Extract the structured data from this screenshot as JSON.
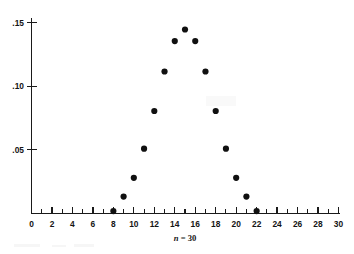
{
  "figure": {
    "name": "binomial-distribution-scatter-plot",
    "background_color": "#ffffff",
    "ink_color": "#101010"
  },
  "chart_data": {
    "type": "scatter",
    "title": "",
    "subtitle": "",
    "xlabel": "n = 30",
    "xlabel_italic_part": "n",
    "xlabel_plain_part": " = 30",
    "ylabel": "",
    "grid": false,
    "legend": null,
    "xlim": [
      0,
      30
    ],
    "ylim": [
      0,
      0.155
    ],
    "xticks_major": [
      0,
      2,
      4,
      6,
      8,
      10,
      12,
      14,
      16,
      18,
      20,
      22,
      24,
      26,
      28,
      30
    ],
    "xtick_labels": [
      "0",
      "2",
      "4",
      "6",
      "8",
      "10",
      "12",
      "14",
      "16",
      "18",
      "20",
      "22",
      "24",
      "26",
      "28",
      "30"
    ],
    "xticks_minor": [
      1,
      3,
      5,
      7,
      9,
      11,
      13,
      15,
      17,
      19,
      21,
      23,
      25,
      27,
      29
    ],
    "xtick_step": 1,
    "yticks": [
      0.05,
      0.1,
      0.15
    ],
    "ytick_labels": [
      ".05",
      ".10",
      ".15"
    ],
    "x": [
      8,
      9,
      10,
      11,
      12,
      13,
      14,
      15,
      16,
      17,
      18,
      19,
      20,
      21,
      22
    ],
    "values": [
      0.0019,
      0.0133,
      0.028,
      0.0509,
      0.0805,
      0.1115,
      0.1354,
      0.1445,
      0.1354,
      0.1115,
      0.0805,
      0.0509,
      0.028,
      0.0133,
      0.0019
    ],
    "point_labels": [],
    "marker": "filled-circle",
    "marker_color": "#101010",
    "marker_size_px": 3.1
  }
}
